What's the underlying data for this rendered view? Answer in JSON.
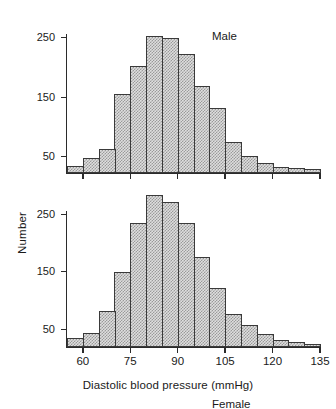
{
  "figure": {
    "ylabel": "Number",
    "xlabel": "Diastolic blood pressure (mmHg)"
  },
  "panels": [
    {
      "key": "male",
      "title": "Male"
    },
    {
      "key": "female",
      "title": "Female"
    }
  ],
  "chart_data": [
    {
      "type": "bar",
      "title": "Male",
      "xlabel": "Diastolic blood pressure (mmHg)",
      "ylabel": "Number",
      "bin_width": 5,
      "bin_starts": [
        55,
        60,
        65,
        70,
        75,
        80,
        85,
        90,
        95,
        100,
        105,
        110,
        115,
        120,
        125,
        130
      ],
      "categories": [
        "55-60",
        "60-65",
        "65-70",
        "70-75",
        "75-80",
        "80-85",
        "85-90",
        "90-95",
        "95-100",
        "100-105",
        "105-110",
        "110-115",
        "115-120",
        "120-125",
        "125-130",
        "130-135"
      ],
      "values": [
        12,
        25,
        40,
        132,
        180,
        230,
        227,
        200,
        147,
        110,
        52,
        28,
        16,
        10,
        9,
        7
      ],
      "xlim": [
        55,
        135
      ],
      "ylim": [
        0,
        260
      ],
      "xticks": [
        60,
        75,
        90,
        105,
        120,
        135
      ],
      "yticks": [
        50,
        150,
        250
      ],
      "grid": false,
      "legend": "none"
    },
    {
      "type": "bar",
      "title": "Female",
      "xlabel": "Diastolic blood pressure (mmHg)",
      "ylabel": "Number",
      "bin_width": 5,
      "bin_starts": [
        55,
        60,
        65,
        70,
        75,
        80,
        85,
        90,
        95,
        100,
        105,
        110,
        115,
        120,
        125,
        130
      ],
      "categories": [
        "55-60",
        "60-65",
        "65-70",
        "70-75",
        "75-80",
        "80-85",
        "85-90",
        "90-95",
        "95-100",
        "100-105",
        "105-110",
        "110-115",
        "115-120",
        "120-125",
        "125-130",
        "130-135"
      ],
      "values": [
        15,
        25,
        62,
        130,
        215,
        265,
        252,
        215,
        157,
        103,
        57,
        38,
        22,
        12,
        8,
        5
      ],
      "xlim": [
        55,
        135
      ],
      "ylim": [
        0,
        280
      ],
      "xticks": [
        60,
        75,
        90,
        105,
        120,
        135
      ],
      "yticks": [
        50,
        150,
        250
      ],
      "grid": false,
      "legend": "none"
    }
  ],
  "axis": {
    "xtick_labels": [
      "60",
      "75",
      "90",
      "105",
      "120",
      "135"
    ],
    "ytick_labels_male": [
      "50",
      "150",
      "250"
    ],
    "ytick_labels_female": [
      "50",
      "150",
      "250"
    ]
  },
  "colors": {
    "ink": "#2b2b2b",
    "bar_fill": "#dedede",
    "bar_stipple": "#9a9a9a",
    "bar_edge": "#3a3a3a",
    "background": "#ffffff"
  }
}
